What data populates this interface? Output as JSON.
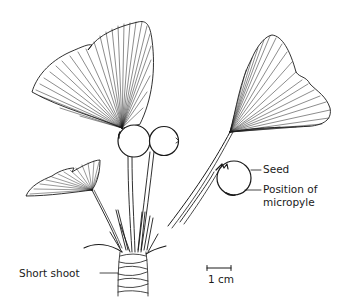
{
  "figure": {
    "labels": {
      "seed": "Seed",
      "micropyle_line1": "Position of",
      "micropyle_line2": "micropyle",
      "short_shoot": "Short shoot"
    },
    "scale_bar": {
      "label": "1 cm"
    },
    "colors": {
      "ink": "#1a1a1a",
      "background": "#ffffff"
    }
  }
}
